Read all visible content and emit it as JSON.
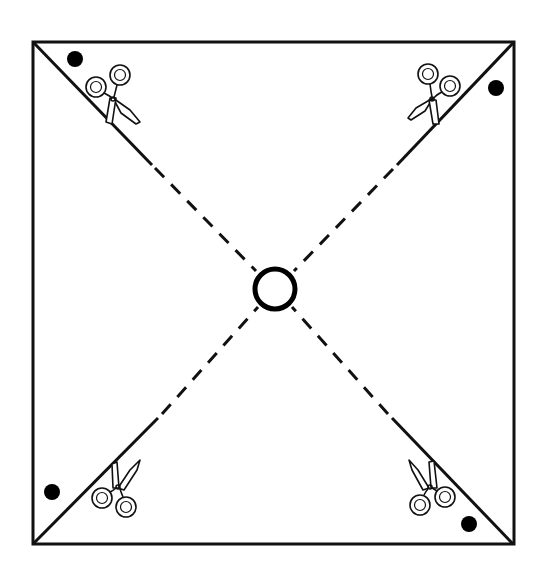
{
  "diagram": {
    "title": "Pinwheel cutting template",
    "colors": {
      "background": "#ffffff",
      "line": "#111111",
      "dot": "#000000"
    },
    "square": {
      "x": 33,
      "y": 42,
      "width": 481,
      "height": 502
    },
    "center_hole": {
      "cx": 275,
      "cy": 289,
      "r": 20,
      "icon": "center-hole-circle"
    },
    "diagonals": [
      {
        "name": "top-left",
        "corner": [
          33,
          42
        ],
        "solid_to": [
          152,
          165
        ],
        "style": "solid-then-dashed"
      },
      {
        "name": "top-right",
        "corner": [
          514,
          42
        ],
        "solid_to": [
          397,
          165
        ],
        "style": "solid-then-dashed"
      },
      {
        "name": "bottom-left",
        "corner": [
          33,
          544
        ],
        "solid_to": [
          158,
          418
        ],
        "style": "solid-then-dashed"
      },
      {
        "name": "bottom-right",
        "corner": [
          513,
          544
        ],
        "solid_to": [
          392,
          418
        ],
        "style": "solid-then-dashed"
      }
    ],
    "dots": [
      {
        "name": "top-left",
        "cx": 75,
        "cy": 59,
        "r": 8
      },
      {
        "name": "top-right",
        "cx": 496,
        "cy": 88,
        "r": 8
      },
      {
        "name": "bottom-left",
        "cx": 52,
        "cy": 492,
        "r": 8
      },
      {
        "name": "bottom-right",
        "cx": 469,
        "cy": 524,
        "r": 8
      }
    ],
    "scissors": [
      {
        "name": "top-left",
        "icon": "scissors-icon",
        "x": 114,
        "y": 98,
        "rotation": 0
      },
      {
        "name": "top-right",
        "icon": "scissors-icon",
        "x": 432,
        "y": 98,
        "rotation": 0
      },
      {
        "name": "bottom-left",
        "icon": "scissors-icon",
        "x": 117,
        "y": 487,
        "rotation": 0
      },
      {
        "name": "bottom-right",
        "icon": "scissors-icon",
        "x": 430,
        "y": 487,
        "rotation": 0
      }
    ]
  }
}
